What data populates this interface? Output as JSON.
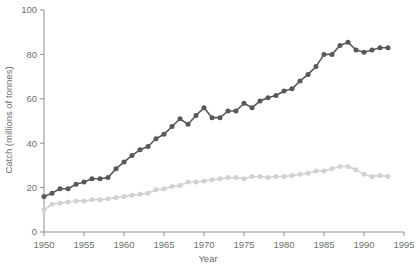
{
  "chart_data": {
    "type": "line",
    "title": "",
    "xlabel": "Year",
    "ylabel": "Catch (millions of tonnes)",
    "xlim": [
      1950,
      1995
    ],
    "ylim": [
      0,
      100
    ],
    "xticks": [
      1950,
      1955,
      1960,
      1965,
      1970,
      1975,
      1980,
      1985,
      1990,
      1995
    ],
    "yticks": [
      0,
      20,
      40,
      60,
      80,
      100
    ],
    "grid": false,
    "legend": "none",
    "x": [
      1950,
      1951,
      1952,
      1953,
      1954,
      1955,
      1956,
      1957,
      1958,
      1959,
      1960,
      1961,
      1962,
      1963,
      1964,
      1965,
      1966,
      1967,
      1968,
      1969,
      1970,
      1971,
      1972,
      1973,
      1974,
      1975,
      1976,
      1977,
      1978,
      1979,
      1980,
      1981,
      1982,
      1983,
      1984,
      1985,
      1986,
      1987,
      1988,
      1989,
      1990,
      1991,
      1992,
      1993
    ],
    "series": [
      {
        "name": "total-catch",
        "color": "#585858",
        "values": [
          16.0,
          17.5,
          19.5,
          19.5,
          21.5,
          22.5,
          24.0,
          24.0,
          24.5,
          28.5,
          31.5,
          34.5,
          37.0,
          38.5,
          42.0,
          44.0,
          47.5,
          51.0,
          48.5,
          52.5,
          56.0,
          51.5,
          51.5,
          54.5,
          54.5,
          58.0,
          56.0,
          59.0,
          60.5,
          61.5,
          63.5,
          64.5,
          68.0,
          71.0,
          74.5,
          80.0,
          80.0,
          84.0,
          85.5,
          82.0,
          81.0,
          82.0,
          83.0,
          83.0
        ]
      },
      {
        "name": "secondary-catch",
        "color": "#d2d2d2",
        "values": [
          10.0,
          12.5,
          13.0,
          13.5,
          14.0,
          14.0,
          14.5,
          14.5,
          15.0,
          15.5,
          16.0,
          16.5,
          17.0,
          17.5,
          19.0,
          19.5,
          20.5,
          21.0,
          22.5,
          22.5,
          23.0,
          23.5,
          24.0,
          24.5,
          24.5,
          24.0,
          25.0,
          25.0,
          24.5,
          25.0,
          25.0,
          25.5,
          26.0,
          26.5,
          27.5,
          27.5,
          28.5,
          29.5,
          29.5,
          28.0,
          26.0,
          25.0,
          25.5,
          25.0
        ]
      }
    ],
    "axis_color": "#8e8e8e",
    "text_color": "#6e6e6e"
  }
}
